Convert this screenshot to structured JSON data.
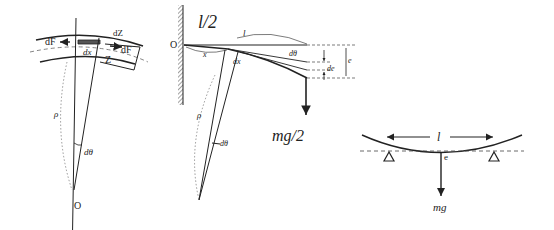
{
  "figure1": {
    "labels": {
      "dF_left": "dF",
      "dF_right": "dF",
      "dZ": "dZ",
      "Z": "Z",
      "dx": "dx",
      "rho": "ρ",
      "dtheta": "dθ",
      "origin": "O"
    }
  },
  "figure2": {
    "labels": {
      "title": "l/2",
      "origin": "O",
      "l": "l",
      "x": "x",
      "dx": "dx",
      "dtheta_top": "dθ",
      "de": "de",
      "e": "e",
      "rho": "ρ",
      "dtheta": "dθ",
      "force": "mg/2"
    }
  },
  "figure3": {
    "labels": {
      "l": "l",
      "e": "e",
      "force": "mg"
    }
  }
}
